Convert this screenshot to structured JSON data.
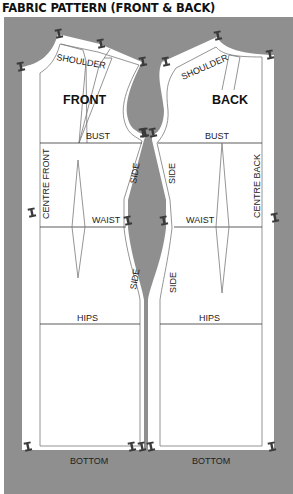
{
  "title": "FABRIC PATTERN (FRONT & BACK)",
  "colors": {
    "fabric": "#8f8f8f",
    "paper": "#ffffff",
    "stitch_line": "#7a7a7a",
    "pin": "#3a3a3a"
  },
  "front_piece": {
    "name": "FRONT",
    "labels": {
      "shoulder": "SHOULDER",
      "bust": "BUST",
      "centre": "CENTRE FRONT",
      "waist": "WAIST",
      "side_upper": "SIDE",
      "side_lower": "SIDE",
      "hips": "HIPS",
      "bottom": "BOTTOM"
    }
  },
  "back_piece": {
    "name": "BACK",
    "labels": {
      "shoulder": "SHOULDER",
      "bust": "BUST",
      "centre": "CENTRE BACK",
      "waist": "WAIST",
      "side_upper": "SIDE",
      "side_lower": "SIDE",
      "hips": "HIPS",
      "bottom": "BOTTOM"
    }
  },
  "pin_icon": "push-pin-icon"
}
